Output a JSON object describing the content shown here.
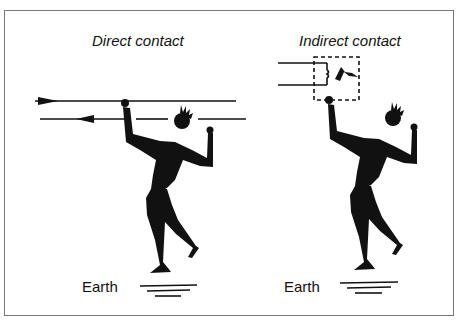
{
  "panels": [
    {
      "title": "Direct contact",
      "ground_label": "Earth"
    },
    {
      "title": "Indirect contact",
      "ground_label": "Earth"
    }
  ],
  "colors": {
    "ink": "#111111",
    "frame": "#777777",
    "background": "#ffffff"
  }
}
